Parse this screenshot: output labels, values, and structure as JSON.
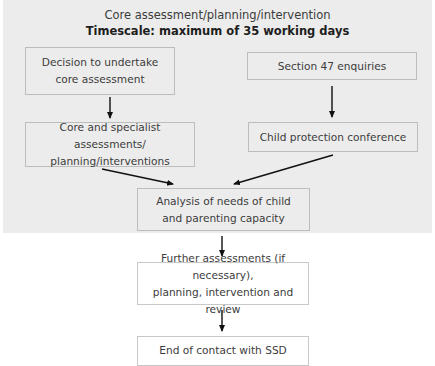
{
  "diagram": {
    "type": "flowchart",
    "header": {
      "title": "Core assessment/planning/intervention",
      "subtitle": "Timescale: maximum of 35 working days"
    },
    "nodes": [
      {
        "id": "decision",
        "label": "Decision to undertake\ncore assessment"
      },
      {
        "id": "s47",
        "label": "Section 47 enquiries"
      },
      {
        "id": "core_specialist",
        "label": "Core and specialist assessments/\nplanning/interventions"
      },
      {
        "id": "cpc",
        "label": "Child protection conference"
      },
      {
        "id": "analysis",
        "label": "Analysis of needs of child\nand parenting capacity"
      },
      {
        "id": "further",
        "label": "Further assessments (if necessary),\nplanning, intervention and review"
      },
      {
        "id": "end",
        "label": "End of contact with SSD"
      }
    ],
    "edges": [
      {
        "from": "decision",
        "to": "core_specialist"
      },
      {
        "from": "s47",
        "to": "cpc"
      },
      {
        "from": "core_specialist",
        "to": "analysis"
      },
      {
        "from": "cpc",
        "to": "analysis"
      },
      {
        "from": "analysis",
        "to": "further"
      },
      {
        "from": "further",
        "to": "end"
      }
    ],
    "colors": {
      "panel_background": "#ececec",
      "page_background": "#ffffff",
      "box_border": "#bdbdbd",
      "arrow": "#111111"
    }
  }
}
